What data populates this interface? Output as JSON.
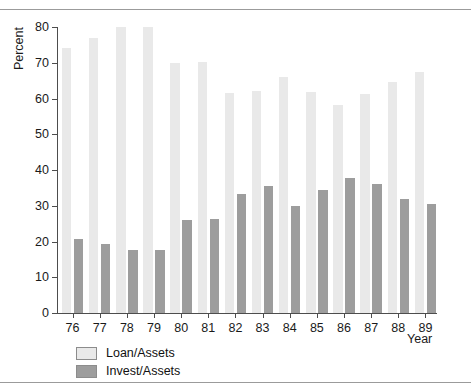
{
  "chart_data": {
    "type": "bar",
    "title": "",
    "xlabel": "Year",
    "ylabel": "Percent",
    "ylim": [
      0,
      80
    ],
    "yticks": [
      0,
      10,
      20,
      30,
      40,
      50,
      60,
      70,
      80
    ],
    "grid": false,
    "legend_position": "below-left",
    "categories": [
      "76",
      "77",
      "78",
      "79",
      "80",
      "81",
      "82",
      "83",
      "84",
      "85",
      "86",
      "87",
      "88",
      "89"
    ],
    "series": [
      {
        "name": "Loan/Assets",
        "color": "#e9e9e9",
        "values": [
          74.2,
          76.8,
          80.0,
          80.0,
          69.8,
          70.2,
          61.5,
          62.2,
          66.0,
          61.8,
          58.2,
          61.4,
          64.5,
          67.5
        ]
      },
      {
        "name": "Invest/Assets",
        "color": "#9d9d9d",
        "values": [
          20.8,
          19.4,
          17.6,
          17.6,
          26.0,
          26.2,
          33.2,
          35.6,
          29.8,
          34.3,
          37.8,
          36.0,
          31.8,
          30.5
        ]
      }
    ]
  },
  "legend": {
    "items": [
      {
        "label": "Loan/Assets",
        "swatch": "loan"
      },
      {
        "label": "Invest/Assets",
        "swatch": "invest"
      }
    ]
  }
}
